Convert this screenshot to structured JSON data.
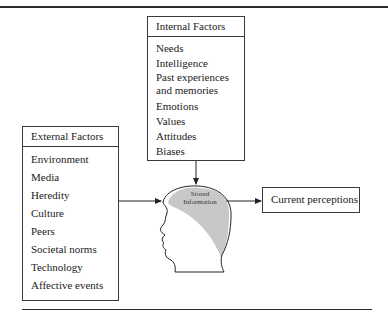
{
  "diagram": {
    "internal_factors": {
      "title": "Internal Factors",
      "items": [
        "Needs",
        "Intelligence",
        "Past experiences and memories",
        "Emotions",
        "Values",
        "Attitudes",
        "Biases"
      ]
    },
    "external_factors": {
      "title": "External Factors",
      "items": [
        "Environment",
        "Media",
        "Heredity",
        "Culture",
        "Peers",
        "Societal norms",
        "Technology",
        "Affective events"
      ]
    },
    "head": {
      "label_line1": "Stored",
      "label_line2": "Information",
      "fill_color": "#c8c8c8"
    },
    "output": {
      "label": "Current perceptions"
    },
    "edges": [
      {
        "from": "Internal Factors",
        "to": "Stored Information"
      },
      {
        "from": "External Factors",
        "to": "Stored Information"
      },
      {
        "from": "Stored Information",
        "to": "Current perceptions"
      }
    ]
  }
}
